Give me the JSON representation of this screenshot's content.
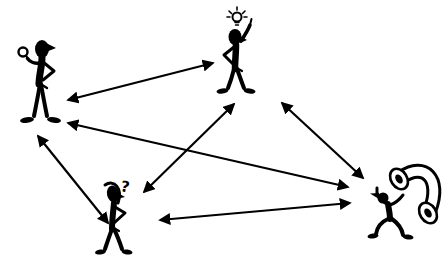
{
  "diagram": {
    "background_color": "#ffffff",
    "ink_color": "#000000",
    "canvas": {
      "width": 445,
      "height": 263
    },
    "figures": [
      {
        "id": "observer",
        "label": "person holding up a small object, hand on hip",
        "icon": "person-with-object-icon",
        "x": 13,
        "y": 36
      },
      {
        "id": "idea",
        "label": "person with lightbulb overhead raising finger",
        "icon": "person-with-idea-icon",
        "x": 213,
        "y": 6
      },
      {
        "id": "question",
        "label": "confused person scratching head",
        "icon": "person-confused-icon",
        "symbol": "?",
        "x": 92,
        "y": 176
      },
      {
        "id": "phone",
        "label": "person carrying oversized telephone handset",
        "icon": "person-with-phone-icon",
        "x": 366,
        "y": 156
      }
    ],
    "arrows": [
      {
        "from": "observer",
        "to": "idea",
        "x1": 68,
        "y1": 100,
        "x2": 213,
        "y2": 63,
        "double_headed": true
      },
      {
        "from": "observer",
        "to": "phone",
        "x1": 68,
        "y1": 123,
        "x2": 348,
        "y2": 187,
        "double_headed": true
      },
      {
        "from": "observer",
        "to": "question",
        "x1": 38,
        "y1": 136,
        "x2": 108,
        "y2": 223,
        "double_headed": true
      },
      {
        "from": "idea",
        "to": "question",
        "x1": 234,
        "y1": 104,
        "x2": 144,
        "y2": 192,
        "double_headed": true
      },
      {
        "from": "idea",
        "to": "phone",
        "x1": 282,
        "y1": 103,
        "x2": 363,
        "y2": 178,
        "double_headed": true
      },
      {
        "from": "question",
        "to": "phone",
        "x1": 160,
        "y1": 220,
        "x2": 350,
        "y2": 203,
        "double_headed": true
      }
    ]
  }
}
